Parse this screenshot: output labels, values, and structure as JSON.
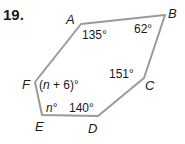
{
  "problem_number": "19.",
  "vertices": {
    "A": {
      "label": "A",
      "x": 81,
      "y": 24
    },
    "B": {
      "label": "B",
      "x": 165,
      "y": 15
    },
    "C": {
      "label": "C",
      "x": 144,
      "y": 78
    },
    "D": {
      "label": "D",
      "x": 98,
      "y": 116
    },
    "E": {
      "label": "E",
      "x": 42,
      "y": 115
    },
    "F": {
      "label": "F",
      "x": 35,
      "y": 82
    }
  },
  "angles": {
    "A": "135°",
    "B": "62°",
    "C": "151°",
    "D": "140°",
    "E": "n°",
    "F": "(n + 6)°"
  },
  "colors": {
    "edge": "#999999",
    "text": "#1a1a1a"
  }
}
